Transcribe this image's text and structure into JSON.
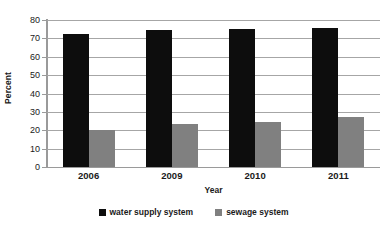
{
  "chart_data": {
    "type": "bar",
    "title": "",
    "subtitle": "",
    "xlabel": "Year",
    "ylabel": "Percent",
    "categories": [
      "2006",
      "2009",
      "2010",
      "2011"
    ],
    "series": [
      {
        "name": "water supply system",
        "color": "#0d0d0d",
        "values": [
          72.5,
          74.5,
          75.0,
          75.5
        ]
      },
      {
        "name": "sewage system",
        "color": "#808080",
        "values": [
          20.0,
          23.5,
          24.5,
          27.5
        ]
      }
    ],
    "ylim": [
      0,
      80
    ],
    "ytick_step": 10,
    "yticks": [
      "80",
      "70",
      "60",
      "50",
      "40",
      "30",
      "20",
      "10",
      "0"
    ],
    "grid": true,
    "grid_axis": "y",
    "legend_position": "bottom-center",
    "bar_gap_within_group": 0,
    "background_color": "#ffffff",
    "gridline_color": "#a6a6a6",
    "text_color": "#1a1a1a"
  }
}
